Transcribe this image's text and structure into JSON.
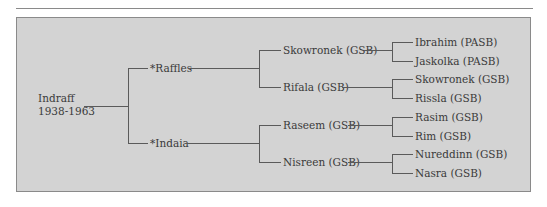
{
  "diagram": {
    "type": "pedigree-chart",
    "root": {
      "name": "Indraff",
      "dates": "1938-1963"
    },
    "sire": {
      "name": "*Raffles",
      "sire": {
        "name": "Skowronek (GSB)",
        "sire": "Ibrahim (PASB)",
        "dam": "Jaskolka (PASB)"
      },
      "dam": {
        "name": "Rifala (GSB)",
        "sire": "Skowronek (GSB)",
        "dam": "Rissla (GSB)"
      }
    },
    "dam": {
      "name": "*Indaia",
      "sire": {
        "name": "Raseem (GSB)",
        "sire": "Rasim (GSB)",
        "dam": "Rim (GSB)"
      },
      "dam": {
        "name": "Nisreen (GSB)",
        "sire": "Nureddinn (GSB)",
        "dam": "Nasra (GSB)"
      }
    }
  },
  "colors": {
    "panel": "#d3d3d3",
    "line": "#5a5a5a",
    "text": "#3a3a3a",
    "border": "#8a8a8a"
  }
}
